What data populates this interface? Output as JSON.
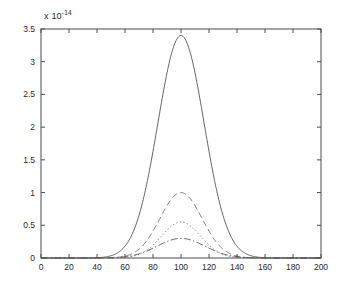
{
  "chart_data": {
    "type": "line",
    "title": "",
    "xlabel": "",
    "ylabel": "",
    "exponent_label": "x 10",
    "exponent_value": "-14",
    "y_scale_factor": 1e-14,
    "xlim": [
      0,
      200
    ],
    "ylim": [
      0,
      3.5
    ],
    "grid": false,
    "legend": "none",
    "xticks": [
      0,
      20,
      40,
      60,
      80,
      100,
      120,
      140,
      160,
      180,
      200
    ],
    "xtick_labels": [
      "0",
      "20",
      "40",
      "60",
      "80",
      "100",
      "120",
      "140",
      "160",
      "180",
      "200"
    ],
    "yticks": [
      0,
      0.5,
      1,
      1.5,
      2,
      2.5,
      3,
      3.5
    ],
    "ytick_labels": [
      "0",
      "0.5",
      "1",
      "1.5",
      "2",
      "2.5",
      "3",
      "3.5"
    ],
    "series": [
      {
        "name": "curve-1",
        "linestyle": "solid",
        "color": "#555555",
        "peak_x": 100,
        "peak_y": 3.4,
        "sigma": 16.5,
        "x": [
          0,
          10,
          20,
          30,
          40,
          45,
          50,
          55,
          60,
          65,
          70,
          75,
          80,
          85,
          90,
          95,
          100,
          105,
          110,
          115,
          120,
          125,
          130,
          135,
          140,
          145,
          150,
          160,
          170,
          180,
          190,
          200
        ],
        "values": [
          0,
          0,
          0,
          0,
          0.001,
          0.004,
          0.012,
          0.035,
          0.089,
          0.2,
          0.41,
          0.76,
          1.25,
          1.88,
          2.56,
          3.13,
          3.4,
          3.28,
          2.83,
          2.2,
          1.53,
          0.96,
          0.55,
          0.28,
          0.13,
          0.055,
          0.02,
          0.002,
          0,
          0,
          0,
          0
        ]
      },
      {
        "name": "curve-2",
        "linestyle": "dashed",
        "color": "#6e6e6e",
        "peak_x": 100,
        "peak_y": 1.0,
        "sigma": 15.0,
        "x": [
          0,
          10,
          20,
          30,
          40,
          45,
          50,
          55,
          60,
          65,
          70,
          75,
          80,
          85,
          90,
          95,
          100,
          105,
          110,
          115,
          120,
          125,
          130,
          135,
          140,
          145,
          150,
          160,
          170,
          180,
          190,
          200
        ],
        "values": [
          0,
          0,
          0,
          0,
          0,
          0.001,
          0.003,
          0.009,
          0.025,
          0.06,
          0.13,
          0.25,
          0.43,
          0.63,
          0.84,
          0.97,
          1.0,
          0.95,
          0.81,
          0.62,
          0.43,
          0.27,
          0.15,
          0.075,
          0.033,
          0.013,
          0.005,
          0.001,
          0,
          0,
          0,
          0
        ]
      },
      {
        "name": "curve-3",
        "linestyle": "dotted",
        "color": "#6e6e6e",
        "peak_x": 100,
        "peak_y": 0.55,
        "sigma": 14.0,
        "x": [
          0,
          10,
          20,
          30,
          40,
          45,
          50,
          55,
          60,
          65,
          70,
          75,
          80,
          85,
          90,
          95,
          100,
          105,
          110,
          115,
          120,
          125,
          130,
          135,
          140,
          145,
          150,
          160,
          170,
          180,
          190,
          200
        ],
        "values": [
          0,
          0,
          0,
          0,
          0,
          0,
          0.001,
          0.004,
          0.012,
          0.03,
          0.068,
          0.135,
          0.23,
          0.35,
          0.465,
          0.54,
          0.55,
          0.52,
          0.44,
          0.33,
          0.22,
          0.13,
          0.07,
          0.033,
          0.014,
          0.005,
          0.002,
          0,
          0,
          0,
          0,
          0
        ]
      },
      {
        "name": "curve-4",
        "linestyle": "dashdot",
        "color": "#4a4a4a",
        "peak_x": 100,
        "peak_y": 0.3,
        "sigma": 17.0,
        "x": [
          0,
          10,
          20,
          30,
          40,
          45,
          50,
          55,
          60,
          65,
          70,
          75,
          80,
          85,
          90,
          95,
          100,
          105,
          110,
          115,
          120,
          125,
          130,
          135,
          140,
          145,
          150,
          160,
          170,
          180,
          190,
          200
        ],
        "values": [
          0,
          0,
          0,
          0,
          0.001,
          0.002,
          0.006,
          0.014,
          0.03,
          0.055,
          0.09,
          0.135,
          0.185,
          0.235,
          0.275,
          0.296,
          0.3,
          0.292,
          0.268,
          0.232,
          0.19,
          0.145,
          0.1,
          0.065,
          0.038,
          0.02,
          0.01,
          0.002,
          0,
          0,
          0,
          0
        ]
      }
    ]
  },
  "axes": {
    "frame_color": "#4d4d4d",
    "background": "#ffffff"
  }
}
